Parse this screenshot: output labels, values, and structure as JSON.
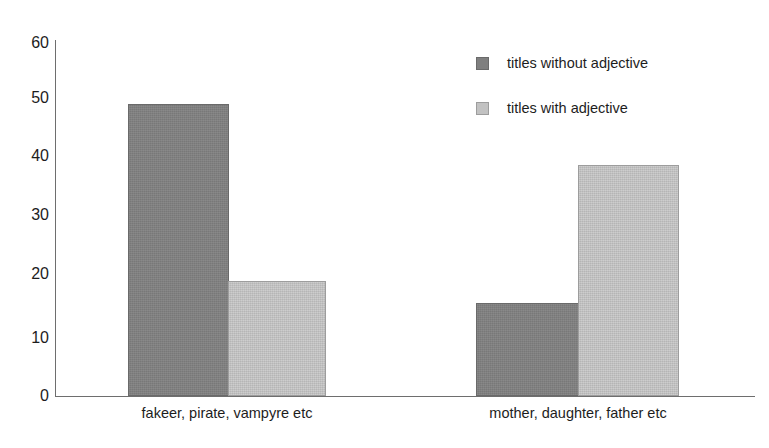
{
  "chart_data": {
    "type": "bar",
    "title": "",
    "subtitle": "",
    "xlabel": "",
    "ylabel": "",
    "ylim": [
      0,
      60
    ],
    "yticks": [
      0,
      10,
      20,
      30,
      40,
      50,
      60
    ],
    "ytick_labels": [
      "0",
      "10",
      "20",
      "30",
      "40",
      "50",
      "60"
    ],
    "grid": false,
    "legend_position": "upper right",
    "categories": [
      "fakeer, pirate, vampyre etc",
      "mother, daughter, father etc"
    ],
    "series": [
      {
        "name": "titles without adjective",
        "color": "#7f7f7f",
        "values": [
          49.7,
          15.8
        ]
      },
      {
        "name": "titles with adjective",
        "color": "#c2c2c2",
        "values": [
          19.5,
          39.3
        ]
      }
    ],
    "bars": [
      {
        "label": "titles without adjective",
        "category": "fakeer, pirate, vampyre etc",
        "value": 49.7,
        "style": "dark"
      },
      {
        "label": "titles with adjective",
        "category": "fakeer, pirate, vampyre etc",
        "value": 19.5,
        "style": "light"
      },
      {
        "label": "titles without adjective",
        "category": "mother, daughter, father etc",
        "value": 15.8,
        "style": "dark"
      },
      {
        "label": "titles with adjective",
        "category": "mother, daughter, father etc",
        "value": 39.3,
        "style": "light"
      }
    ]
  },
  "axis": {
    "y_ticks": [
      "60",
      "50",
      "40",
      "30",
      "20",
      "10",
      "0"
    ]
  },
  "legend": {
    "items": [
      {
        "label": "titles without adjective",
        "style": "dark"
      },
      {
        "label": "titles with adjective",
        "style": "light"
      }
    ]
  },
  "x_labels": [
    "fakeer, pirate, vampyre etc",
    "mother, daughter, father etc"
  ],
  "colors": {
    "series_dark": "#7f7f7f",
    "series_light": "#c2c2c2",
    "axis": "#6e6e6e",
    "text": "#1d1d1d",
    "background": "#ffffff"
  }
}
